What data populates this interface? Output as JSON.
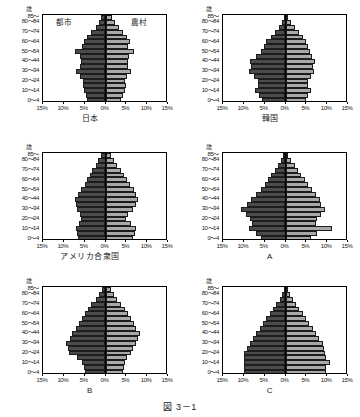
{
  "figure": {
    "caption": "図 3－1",
    "axis_unit": "歳",
    "age_labels": [
      "85～",
      "80～84",
      "75～79",
      "70～74",
      "65～69",
      "60～64",
      "55～59",
      "50～54",
      "45～49",
      "40～44",
      "35～39",
      "30～34",
      "25～29",
      "20～24",
      "15～19",
      "10～14",
      "5～9",
      "0～4"
    ],
    "visible_age_labels": [
      "85～",
      "80～84",
      "70～74",
      "60～64",
      "50～54",
      "40～44",
      "30～34",
      "20～24",
      "10～14",
      "0～4"
    ],
    "x_ticks": [
      "15%",
      "10%",
      "5%",
      "0%",
      "5%",
      "10%",
      "15%"
    ],
    "series": [
      {
        "name": "urban",
        "label": "都市",
        "color": "#4b4b4b",
        "side": "left"
      },
      {
        "name": "rural",
        "label": "農村",
        "color": "#a8a8a8",
        "side": "right"
      }
    ],
    "legend_shown_on": "japan"
  },
  "chart_data": [
    {
      "id": "japan",
      "type": "bar",
      "title": "日本",
      "xlabel": "",
      "ylabel": "歳",
      "xlim": [
        -15,
        15
      ],
      "grid": false,
      "categories": [
        "85～",
        "80～84",
        "75～79",
        "70～74",
        "65～69",
        "60～64",
        "55～59",
        "50～54",
        "45～49",
        "40～44",
        "35～39",
        "30～34",
        "25～29",
        "20～24",
        "15～19",
        "10～14",
        "5～9",
        "0～4"
      ],
      "series": [
        {
          "name": "都市",
          "values": [
            1.0,
            1.6,
            2.4,
            3.4,
            4.4,
            5.2,
            5.6,
            7.4,
            6.2,
            6.0,
            6.2,
            7.0,
            6.1,
            5.4,
            5.4,
            5.2,
            4.7,
            4.4
          ]
        },
        {
          "name": "農村",
          "values": [
            1.5,
            2.2,
            3.2,
            4.2,
            5.2,
            5.9,
            5.4,
            6.8,
            5.6,
            5.3,
            5.4,
            6.0,
            5.2,
            4.6,
            4.8,
            4.6,
            4.2,
            3.8
          ]
        }
      ]
    },
    {
      "id": "korea",
      "type": "bar",
      "title": "韓国",
      "xlabel": "",
      "ylabel": "歳",
      "xlim": [
        -15,
        15
      ],
      "grid": false,
      "categories": [
        "85～",
        "80～84",
        "75～79",
        "70～74",
        "65～69",
        "60～64",
        "55～59",
        "50～54",
        "45～49",
        "40～44",
        "35～39",
        "30～34",
        "25～29",
        "20～24",
        "15～19",
        "10～14",
        "5～9",
        "0～4"
      ],
      "series": [
        {
          "name": "都市",
          "values": [
            0.4,
            0.9,
            1.6,
            2.6,
            3.6,
            4.6,
            5.2,
            6.0,
            7.0,
            8.6,
            8.2,
            8.8,
            7.6,
            6.6,
            6.6,
            7.4,
            6.4,
            5.6
          ]
        },
        {
          "name": "農村",
          "values": [
            0.6,
            1.3,
            2.2,
            3.2,
            4.2,
            5.0,
            5.4,
            5.8,
            6.4,
            7.0,
            6.6,
            6.8,
            6.0,
            5.4,
            5.4,
            6.0,
            5.4,
            4.8
          ]
        }
      ]
    },
    {
      "id": "usa",
      "type": "bar",
      "title": "アメリカ合衆国",
      "xlabel": "",
      "ylabel": "歳",
      "xlim": [
        -15,
        15
      ],
      "grid": false,
      "categories": [
        "85～",
        "80～84",
        "75～79",
        "70～74",
        "65～69",
        "60～64",
        "55～59",
        "50～54",
        "45～49",
        "40～44",
        "35～39",
        "30～34",
        "25～29",
        "20～24",
        "15～19",
        "10～14",
        "5～9",
        "0～4"
      ],
      "series": [
        {
          "name": "都市",
          "values": [
            1.2,
            1.8,
            2.4,
            3.2,
            3.8,
            4.4,
            5.0,
            6.0,
            6.6,
            7.4,
            7.0,
            6.8,
            6.2,
            5.8,
            6.4,
            7.0,
            6.8,
            6.6
          ]
        },
        {
          "name": "農村",
          "values": [
            1.4,
            2.0,
            2.8,
            3.6,
            4.4,
            5.2,
            5.8,
            6.8,
            7.2,
            7.8,
            7.2,
            6.6,
            5.4,
            5.0,
            6.0,
            7.4,
            7.0,
            6.6
          ]
        }
      ]
    },
    {
      "id": "A",
      "type": "bar",
      "title": "A",
      "xlabel": "",
      "ylabel": "歳",
      "xlim": [
        -15,
        15
      ],
      "grid": false,
      "categories": [
        "85～",
        "80～84",
        "75～79",
        "70～74",
        "65～69",
        "60～64",
        "55～59",
        "50～54",
        "45～49",
        "40～44",
        "35～39",
        "30～34",
        "25～29",
        "20～24",
        "15～19",
        "10～14",
        "5～9",
        "0～4"
      ],
      "series": [
        {
          "name": "都市",
          "values": [
            0.5,
            1.0,
            1.8,
            2.6,
            3.4,
            4.2,
            5.0,
            6.0,
            7.2,
            8.4,
            9.2,
            10.6,
            9.4,
            8.6,
            8.0,
            8.8,
            7.2,
            6.0
          ]
        },
        {
          "name": "農村",
          "values": [
            0.7,
            1.4,
            2.2,
            3.0,
            3.8,
            4.6,
            5.4,
            6.4,
            7.4,
            8.2,
            8.6,
            9.4,
            8.6,
            7.6,
            7.2,
            11.2,
            7.6,
            6.2
          ]
        }
      ]
    },
    {
      "id": "B",
      "type": "bar",
      "title": "B",
      "xlabel": "",
      "ylabel": "歳",
      "xlim": [
        -15,
        15
      ],
      "grid": false,
      "categories": [
        "85～",
        "80～84",
        "75～79",
        "70～74",
        "65～69",
        "60～64",
        "55～59",
        "50～54",
        "45～49",
        "40～44",
        "35～39",
        "30～34",
        "25～29",
        "20～24",
        "15～19",
        "10～14",
        "5～9",
        "0～4"
      ],
      "series": [
        {
          "name": "都市",
          "values": [
            0.8,
            1.6,
            2.4,
            3.4,
            4.2,
            5.0,
            5.6,
            6.4,
            7.2,
            8.0,
            8.6,
            9.4,
            9.0,
            8.8,
            6.8,
            5.6,
            5.2,
            5.0
          ]
        },
        {
          "name": "農村",
          "values": [
            1.2,
            2.0,
            2.8,
            3.8,
            4.6,
            5.4,
            6.0,
            6.8,
            7.4,
            8.2,
            7.8,
            7.4,
            6.6,
            6.0,
            5.2,
            4.6,
            4.4,
            4.2
          ]
        }
      ]
    },
    {
      "id": "C",
      "type": "bar",
      "title": "C",
      "xlabel": "",
      "ylabel": "歳",
      "xlim": [
        -15,
        15
      ],
      "grid": false,
      "categories": [
        "85～",
        "80～84",
        "75～79",
        "70～74",
        "65～69",
        "60～64",
        "55～59",
        "50～54",
        "45～49",
        "40～44",
        "35～39",
        "30～34",
        "25～29",
        "20～24",
        "15～19",
        "10～14",
        "5～9",
        "0～4"
      ],
      "series": [
        {
          "name": "都市",
          "values": [
            0.3,
            0.8,
            1.4,
            2.2,
            3.0,
            3.8,
            4.6,
            5.4,
            6.2,
            7.0,
            7.8,
            8.6,
            9.2,
            10.0,
            10.0,
            10.0,
            10.0,
            10.0
          ]
        },
        {
          "name": "農村",
          "values": [
            0.4,
            1.0,
            1.7,
            2.5,
            3.3,
            4.1,
            4.9,
            5.7,
            6.5,
            7.3,
            8.1,
            8.9,
            9.2,
            9.4,
            9.6,
            10.6,
            9.8,
            9.6
          ]
        }
      ]
    }
  ]
}
